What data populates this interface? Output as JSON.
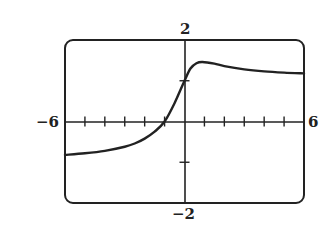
{
  "labels": {
    "ymax": "2",
    "ymin": "−2",
    "xmin": "−6",
    "xmax": "6"
  },
  "chart_data": {
    "type": "line",
    "title": "",
    "xlabel": "",
    "ylabel": "",
    "xlim": [
      -6,
      6
    ],
    "ylim": [
      -2,
      2
    ],
    "x_ticks": [
      -5,
      -4,
      -3,
      -2,
      -1,
      1,
      2,
      3,
      4,
      5
    ],
    "y_ticks": [
      -1,
      1
    ],
    "grid": false,
    "legend": null,
    "series": [
      {
        "name": "f(x)",
        "x": [
          -6,
          -5,
          -4,
          -3,
          -2.5,
          -2,
          -1.5,
          -1,
          -0.5,
          0,
          0.3,
          0.6,
          0.9,
          1.5,
          2,
          3,
          4,
          5,
          6
        ],
        "y": [
          -0.82,
          -0.78,
          -0.72,
          -0.62,
          -0.54,
          -0.42,
          -0.25,
          0.0,
          0.45,
          1.0,
          1.3,
          1.43,
          1.46,
          1.42,
          1.36,
          1.28,
          1.23,
          1.2,
          1.18
        ]
      }
    ]
  }
}
